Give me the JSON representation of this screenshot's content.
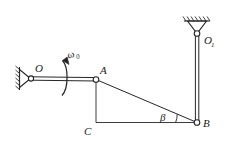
{
  "figure": {
    "background_color": "#ffffff",
    "line_color": "#262626",
    "label_color": "#1a1a1a",
    "width": 227,
    "height": 155
  },
  "labels": {
    "pivot_o": "O",
    "pivot_o1_base": "O",
    "pivot_o1_sub": "1",
    "joint_a": "A",
    "joint_b": "B",
    "corner_c": "C",
    "omega_base": "ω",
    "omega_sub": "0",
    "angle_beta": "β"
  },
  "geometry": {
    "points": {
      "O": {
        "x": 31,
        "y": 78.5,
        "name": "fixed-pivot-o"
      },
      "A": {
        "x": 96,
        "y": 79.5,
        "name": "joint-a"
      },
      "B": {
        "x": 197,
        "y": 122.5,
        "name": "joint-b"
      },
      "C": {
        "x": 96,
        "y": 122.5,
        "name": "corner-c"
      },
      "O1": {
        "x": 197,
        "y": 33.5,
        "name": "fixed-pivot-o1"
      }
    },
    "members": [
      {
        "name": "crank-oa",
        "from": "O",
        "to": "A",
        "style": "double-line"
      },
      {
        "name": "coupler-ab",
        "from": "A",
        "to": "B",
        "style": "single-line"
      },
      {
        "name": "rocker-o1b",
        "from": "O1",
        "to": "B",
        "style": "double-line"
      },
      {
        "name": "reference-ac",
        "from": "A",
        "to": "C",
        "style": "thin-line"
      },
      {
        "name": "reference-cb",
        "from": "C",
        "to": "B",
        "style": "thin-line"
      }
    ],
    "supports": [
      {
        "name": "ground-support-o",
        "orientation": "vertical-left",
        "x": 20,
        "y": 78.5
      },
      {
        "name": "ground-support-o1",
        "orientation": "horizontal-top",
        "x": 197,
        "y": 21
      }
    ],
    "angle_arc": {
      "name": "angle-beta-arc",
      "vertex": "B",
      "radius": 22,
      "from_deg": 180,
      "to_deg": 203
    }
  }
}
